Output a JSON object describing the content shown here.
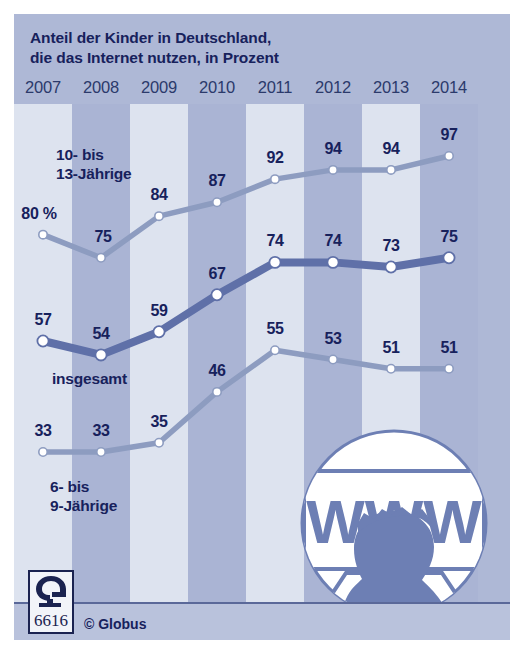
{
  "title": {
    "line1": "Anteil der Kinder in Deutschland,",
    "line2": "die das Internet nutzen, in Prozent"
  },
  "footer": {
    "copyright": "© Globus",
    "logo_number": "6616",
    "logo_letter": "G"
  },
  "illustration": {
    "screen_text": "WWW"
  },
  "series_labels": {
    "top": {
      "line1": "10- bis",
      "line2": "13-Jährige"
    },
    "middle": "insgesamt",
    "bottom": {
      "line1": "6- bis",
      "line2": "9-Jährige"
    },
    "unit_first_point": "80 %"
  },
  "colors": {
    "panel_background": "#aeb8d6",
    "stripe_light": "#dde3ef",
    "stripe_dark": "#aab4d4",
    "text_dark": "#17215c",
    "line_top": "#8d9cc0",
    "line_middle": "#5f70a8",
    "line_bottom": "#8d9cc0",
    "marker_fill": "#ffffff",
    "footer_band": "#b9c2dc",
    "illustration_fill": "#6d7fb4"
  },
  "chart_data": {
    "type": "line",
    "title": "Anteil der Kinder in Deutschland, die das Internet nutzen, in Prozent",
    "xlabel": "",
    "ylabel": "Prozent",
    "ylim": [
      25,
      100
    ],
    "grid": false,
    "legend": "inline-labels",
    "categories": [
      "2007",
      "2008",
      "2009",
      "2010",
      "2011",
      "2012",
      "2013",
      "2014"
    ],
    "series": [
      {
        "name": "10- bis 13-Jährige",
        "values": [
          80,
          75,
          84,
          87,
          92,
          94,
          94,
          97
        ],
        "labels": [
          "80 %",
          "75",
          "84",
          "87",
          "92",
          "94",
          "94",
          "97"
        ]
      },
      {
        "name": "insgesamt",
        "values": [
          57,
          54,
          59,
          67,
          74,
          74,
          73,
          75
        ],
        "labels": [
          "57",
          "54",
          "59",
          "67",
          "74",
          "74",
          "73",
          "75"
        ]
      },
      {
        "name": "6- bis 9-Jährige",
        "values": [
          33,
          33,
          35,
          46,
          55,
          53,
          51,
          51
        ],
        "labels": [
          "33",
          "33",
          "35",
          "46",
          "55",
          "53",
          "51",
          "51"
        ]
      }
    ]
  }
}
